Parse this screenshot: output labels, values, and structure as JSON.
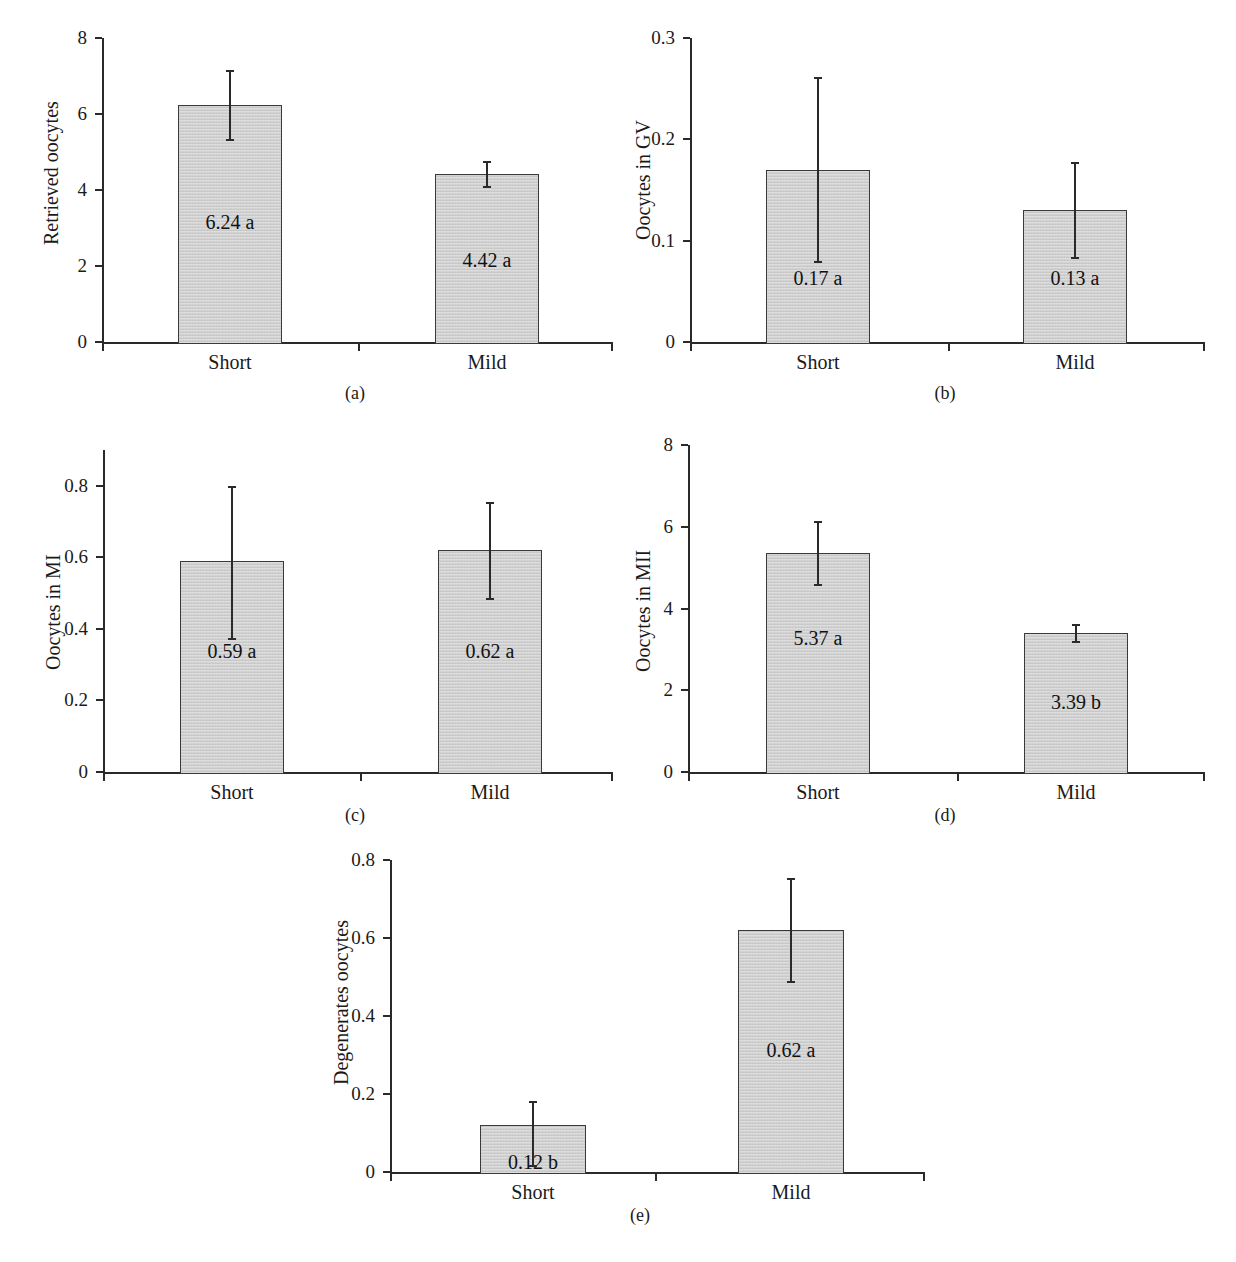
{
  "figure": {
    "categories": [
      "Short",
      "Mild"
    ],
    "panel_captions": [
      "(a)",
      "(b)",
      "(c)",
      "(d)",
      "(e)"
    ]
  },
  "chart_data": [
    {
      "id": "a",
      "type": "bar",
      "title": "",
      "caption": "(a)",
      "xlabel": "",
      "ylabel": "Retrieved oocytes",
      "categories": [
        "Short",
        "Mild"
      ],
      "values": [
        6.24,
        4.42
      ],
      "value_labels": [
        "6.24 a",
        "4.42 a"
      ],
      "errors_low": [
        5.28,
        4.04
      ],
      "errors_high": [
        7.17,
        4.76
      ],
      "ylim": [
        0,
        8
      ],
      "yticks": [
        0,
        2,
        4,
        6,
        8
      ],
      "ytick_labels": [
        "0",
        "2",
        "4",
        "6",
        "8"
      ],
      "grid": false,
      "legend": "none"
    },
    {
      "id": "b",
      "type": "bar",
      "title": "",
      "caption": "(b)",
      "xlabel": "",
      "ylabel": "Oocytes in GV",
      "categories": [
        "Short",
        "Mild"
      ],
      "values": [
        0.17,
        0.13
      ],
      "value_labels": [
        "0.17 a",
        "0.13 a"
      ],
      "errors_low": [
        0.078,
        0.082
      ],
      "errors_high": [
        0.262,
        0.178
      ],
      "ylim": [
        0,
        0.3
      ],
      "yticks": [
        0,
        0.1,
        0.2,
        0.3
      ],
      "ytick_labels": [
        "0",
        "0.1",
        "0.2",
        "0.3"
      ],
      "grid": false,
      "legend": "none"
    },
    {
      "id": "c",
      "type": "bar",
      "title": "",
      "caption": "(c)",
      "xlabel": "",
      "ylabel": "Oocytes in MI",
      "categories": [
        "Short",
        "Mild"
      ],
      "values": [
        0.59,
        0.62
      ],
      "value_labels": [
        "0.59 a",
        "0.62 a"
      ],
      "errors_low": [
        0.37,
        0.48
      ],
      "errors_high": [
        0.8,
        0.755
      ],
      "ylim": [
        0,
        0.9
      ],
      "yticks": [
        0,
        0.2,
        0.4,
        0.6,
        0.8
      ],
      "ytick_labels": [
        "0",
        "0.2",
        "0.4",
        "0.6",
        "0.8"
      ],
      "grid": false,
      "legend": "none"
    },
    {
      "id": "d",
      "type": "bar",
      "title": "",
      "caption": "(d)",
      "xlabel": "",
      "ylabel": "Oocytes in MII",
      "categories": [
        "Short",
        "Mild"
      ],
      "values": [
        5.37,
        3.39
      ],
      "value_labels": [
        "5.37 a",
        "3.39 b"
      ],
      "errors_low": [
        4.54,
        3.15
      ],
      "errors_high": [
        6.13,
        3.62
      ],
      "ylim": [
        0,
        8
      ],
      "yticks": [
        0,
        2,
        4,
        6,
        8
      ],
      "ytick_labels": [
        "0",
        "2",
        "4",
        "6",
        "8"
      ],
      "grid": false,
      "legend": "none"
    },
    {
      "id": "e",
      "type": "bar",
      "title": "",
      "caption": "(e)",
      "xlabel": "",
      "ylabel": "Degenerates oocytes",
      "categories": [
        "Short",
        "Mild"
      ],
      "values": [
        0.12,
        0.62
      ],
      "value_labels": [
        "0.12 b",
        "0.62 a"
      ],
      "errors_low": [
        0.013,
        0.485
      ],
      "errors_high": [
        0.182,
        0.755
      ],
      "ylim": [
        0,
        0.8
      ],
      "yticks": [
        0,
        0.2,
        0.4,
        0.6,
        0.8
      ],
      "ytick_labels": [
        "0",
        "0.2",
        "0.4",
        "0.6",
        "0.8"
      ],
      "grid": false,
      "legend": "none"
    }
  ]
}
